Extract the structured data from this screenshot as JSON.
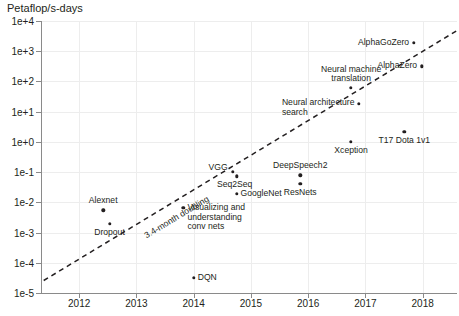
{
  "chart_data": {
    "type": "scatter",
    "title": "",
    "ylabel": "Petaflop/s-days",
    "xlabel": "",
    "xlim": [
      2011.35,
      2018.6
    ],
    "ylim": [
      1e-05,
      10000.0
    ],
    "yscale": "log",
    "grid": true,
    "legend": "none",
    "ytick_labels": [
      "1e+4",
      "1e+3",
      "1e+2",
      "1e+1",
      "1e+0",
      "1e-1",
      "1e-2",
      "1e-3",
      "1e-4",
      "1e-5"
    ],
    "ytick_values": [
      10000,
      1000,
      100,
      10,
      1,
      0.1,
      0.01,
      0.001,
      0.0001,
      1e-05
    ],
    "xtick_labels": [
      "2012",
      "2013",
      "2014",
      "2015",
      "2016",
      "2017",
      "2018"
    ],
    "xtick_values": [
      2012,
      2013,
      2014,
      2015,
      2016,
      2017,
      2018
    ],
    "points": [
      {
        "label": "AlphaGoZero",
        "x": 2017.85,
        "y": 1900,
        "anchor": "r",
        "dx": -5,
        "dy": 0
      },
      {
        "label": "AlphaZero",
        "x": 2017.99,
        "y": 320,
        "anchor": "r",
        "dx": -5,
        "dy": 0
      },
      {
        "label": "Neural machine\ntranslation",
        "x": 2016.75,
        "y": 62,
        "anchor": "cb",
        "dx": 0,
        "dy": -4
      },
      {
        "label": "Neural architecture\nsearch",
        "x": 2016.88,
        "y": 18,
        "anchor": "r",
        "dx": -4,
        "dy": 4
      },
      {
        "label": "Xception",
        "x": 2016.75,
        "y": 1.0,
        "anchor": "ct",
        "dx": 0,
        "dy": 4
      },
      {
        "label": "T17 Dota 1v1",
        "x": 2017.68,
        "y": 2.2,
        "anchor": "ct",
        "dx": 0,
        "dy": 4
      },
      {
        "label": "DeepSpeech2",
        "x": 2015.86,
        "y": 0.078,
        "anchor": "cb",
        "dx": 0,
        "dy": -4
      },
      {
        "label": "ResNets",
        "x": 2015.86,
        "y": 0.04,
        "anchor": "ct",
        "dx": 0,
        "dy": 4
      },
      {
        "label": "VGG",
        "x": 2014.68,
        "y": 0.1,
        "anchor": "r",
        "dx": -5,
        "dy": -4
      },
      {
        "label": "Seq2Seq",
        "x": 2014.75,
        "y": 0.072,
        "anchor": "ct",
        "dx": -2,
        "dy": 4
      },
      {
        "label": "GoogleNet",
        "x": 2014.75,
        "y": 0.019,
        "anchor": "l",
        "dx": 4,
        "dy": 0
      },
      {
        "label": "Visualizing and\nunderstanding\nconv nets",
        "x": 2013.82,
        "y": 0.0065,
        "anchor": "l",
        "dx": 4,
        "dy": 9
      },
      {
        "label": "Alexnet",
        "x": 2012.42,
        "y": 0.0055,
        "anchor": "cb",
        "dx": 0,
        "dy": -4
      },
      {
        "label": "Dropout",
        "x": 2012.53,
        "y": 0.002,
        "anchor": "ct",
        "dx": 0,
        "dy": 4
      },
      {
        "label": "DQN",
        "x": 2014.0,
        "y": 3.2e-05,
        "anchor": "l",
        "dx": 4,
        "dy": 0
      }
    ],
    "trendline": {
      "label": "3.4-month doubling",
      "x_start": 2011.38,
      "y_start": 2.6e-05,
      "x_end": 2018.6,
      "y_end": 4800
    }
  }
}
